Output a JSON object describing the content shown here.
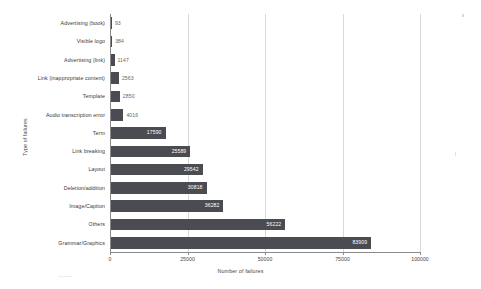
{
  "chart_data": {
    "type": "bar",
    "orientation": "horizontal",
    "title": "",
    "xlabel": "Number of failures",
    "ylabel": "Type of failures",
    "xlim": [
      0,
      100000
    ],
    "ylim": null,
    "grid": true,
    "legend": null,
    "xticks": [
      "0",
      "25000",
      "50000",
      "75000",
      "100000"
    ],
    "xtick_values": [
      0,
      25000,
      50000,
      75000,
      100000
    ],
    "categories": [
      "Advertising (book)",
      "Visible logo",
      "Advertising (link)",
      "Link (inappropriate content)",
      "Template",
      "Audio transcription error",
      "Term",
      "Link breaking",
      "Layout",
      "Deletion/addition",
      "Image/Caption",
      "Others",
      "Grammar/Graphics"
    ],
    "values": [
      93,
      384,
      1147,
      2563,
      2850,
      4016,
      17590,
      25589,
      29542,
      30818,
      36282,
      56222,
      83909
    ],
    "value_labels": [
      "93",
      "384",
      "1147",
      "2563",
      "2850",
      "4016",
      "17590",
      "25589",
      "29542",
      "30818",
      "36282",
      "56222",
      "83909"
    ],
    "label_placement": [
      "outside",
      "outside",
      "outside",
      "outside",
      "outside",
      "outside",
      "inside",
      "inside",
      "inside",
      "inside",
      "inside",
      "inside",
      "inside"
    ],
    "bar_color": "#4b4b52",
    "grid_color": "#d9d9d9",
    "background_color": "#ffffff"
  }
}
